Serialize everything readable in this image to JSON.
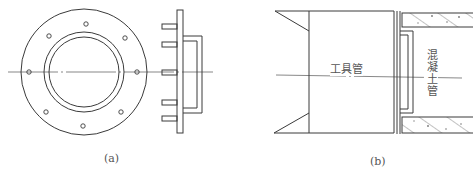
{
  "figure": {
    "panels": [
      {
        "id": "a",
        "label": "(a)",
        "description": "Flange plate front view with 8 bolt holes and side view with studs and bracket"
      },
      {
        "id": "b",
        "label": "(b)",
        "description": "Tool pipe connected to concrete pipe, section view",
        "labels": {
          "tool_pipe": "工具管",
          "concrete_pipe": "混凝土管"
        }
      }
    ],
    "colors": {
      "line": "#3a3a3a",
      "centerline": "#555555",
      "hatch": "#666666",
      "background": "#ffffff"
    }
  }
}
